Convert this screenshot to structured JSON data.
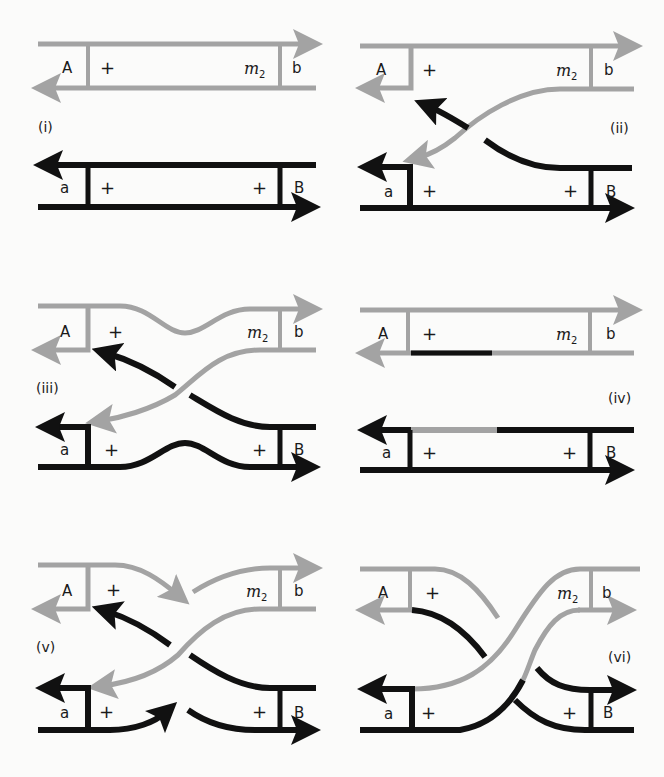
{
  "figure": {
    "colors": {
      "grey_strand": "#a3a3a3",
      "black_strand": "#111111",
      "background": "#fbfbfa"
    },
    "panels": [
      {
        "id": "i",
        "label": "(i)",
        "top": {
          "left": "A",
          "plus": "+",
          "right_marker": "m",
          "right_sub": "2",
          "right": "b"
        },
        "bottom": {
          "left": "a",
          "plus_left": "+",
          "plus_right": "+",
          "right": "B"
        }
      },
      {
        "id": "ii",
        "label": "(ii)",
        "top": {
          "left": "A",
          "plus": "+",
          "right_marker": "m",
          "right_sub": "2",
          "right": "b"
        },
        "bottom": {
          "left": "a",
          "plus_left": "+",
          "plus_right": "+",
          "right": "B"
        }
      },
      {
        "id": "iii",
        "label": "(iii)",
        "top": {
          "left": "A",
          "plus": "+",
          "right_marker": "m",
          "right_sub": "2",
          "right": "b"
        },
        "bottom": {
          "left": "a",
          "plus_left": "+",
          "plus_right": "+",
          "right": "B"
        }
      },
      {
        "id": "iv",
        "label": "(iv)",
        "top": {
          "left": "A",
          "plus": "+",
          "right_marker": "m",
          "right_sub": "2",
          "right": "b"
        },
        "bottom": {
          "left": "a",
          "plus_left": "+",
          "plus_right": "+",
          "right": "B"
        }
      },
      {
        "id": "v",
        "label": "(v)",
        "top": {
          "left": "A",
          "plus": "+",
          "right_marker": "m",
          "right_sub": "2",
          "right": "b"
        },
        "bottom": {
          "left": "a",
          "plus_left": "+",
          "plus_right": "+",
          "right": "B"
        }
      },
      {
        "id": "vi",
        "label": "(vi)",
        "top": {
          "left": "A",
          "plus": "+",
          "right_marker": "m",
          "right_sub": "2",
          "right": "b"
        },
        "bottom": {
          "left": "a",
          "plus_left": "+",
          "plus_right": "+",
          "right": "B"
        }
      }
    ]
  }
}
